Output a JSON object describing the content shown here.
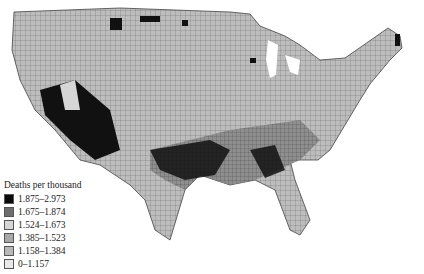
{
  "map": {
    "subject": "United States counties choropleth",
    "legend": {
      "title": "Deaths per thousand",
      "items": [
        {
          "label": "1.875–2.973",
          "color": "#0a0a0a"
        },
        {
          "label": "1.675–1.874",
          "color": "#6e6e6e"
        },
        {
          "label": "1.524–1.673",
          "color": "#d6d6d6"
        },
        {
          "label": "1.385–1.523",
          "color": "#a8a8a8"
        },
        {
          "label": "1.158–1.384",
          "color": "#b8b8b8"
        },
        {
          "label": "0–1.157",
          "color": "#e8e8e8"
        }
      ]
    }
  }
}
